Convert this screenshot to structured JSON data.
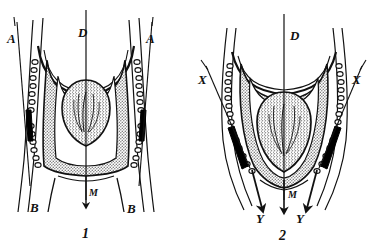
{
  "figure": {
    "caption_style": "anatomical line drawing, two panels",
    "background_color": "#ffffff",
    "ink_color": "#111111",
    "shaded_fill_color": "#b8b8b8",
    "organ_fill_color": "#c9c9c9",
    "solid_bar_color": "#000000"
  },
  "panels": [
    {
      "id": "panel-1",
      "number": "1",
      "labels": [
        {
          "name": "label-A-left",
          "text": "A",
          "x": 7,
          "y": 38
        },
        {
          "name": "label-A-right",
          "text": "A",
          "x": 146,
          "y": 38
        },
        {
          "name": "label-D",
          "text": "D",
          "x": 78,
          "y": 37
        },
        {
          "name": "label-B-left",
          "text": "B",
          "x": 30,
          "y": 206
        },
        {
          "name": "label-B-right",
          "text": "B",
          "x": 127,
          "y": 207
        },
        {
          "name": "label-M",
          "text": "M",
          "x": 80,
          "y": 194
        }
      ]
    },
    {
      "id": "panel-2",
      "number": "2",
      "labels": [
        {
          "name": "label-X-left",
          "text": "X",
          "x": 198,
          "y": 79
        },
        {
          "name": "label-X-right",
          "text": "X",
          "x": 352,
          "y": 79
        },
        {
          "name": "label-D",
          "text": "D",
          "x": 290,
          "y": 35
        },
        {
          "name": "label-Y-left",
          "text": "Y",
          "x": 258,
          "y": 217
        },
        {
          "name": "label-Y-right",
          "text": "Y",
          "x": 296,
          "y": 217
        },
        {
          "name": "label-M",
          "text": "M",
          "x": 288,
          "y": 196
        }
      ]
    }
  ],
  "legend_keys": {
    "A": "A",
    "B": "B",
    "D": "D",
    "M": "M",
    "X": "X",
    "Y": "Y"
  }
}
